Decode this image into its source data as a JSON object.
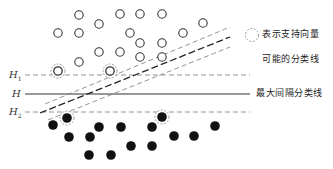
{
  "diagram": {
    "type": "svm-max-margin",
    "colors": {
      "open_stroke": "#333333",
      "filled": "#111111",
      "line": "#333333",
      "dashed": "#777777"
    },
    "labels": {
      "h1": "H",
      "h1_sub": "1",
      "h": "H",
      "h2": "H",
      "h2_sub": "2"
    },
    "legend": {
      "support_vector": "表示支持向量",
      "possible_lines": "可能的分类线",
      "max_margin_line": "最大间隔分类线"
    },
    "open_points": [
      [
        79,
        15
      ],
      [
        120,
        14
      ],
      [
        140,
        14
      ],
      [
        162,
        14
      ],
      [
        99,
        24
      ],
      [
        203,
        23
      ],
      [
        58,
        33
      ],
      [
        79,
        33
      ],
      [
        130,
        33
      ],
      [
        183,
        33
      ],
      [
        140,
        43
      ],
      [
        162,
        43
      ],
      [
        99,
        52
      ],
      [
        120,
        52
      ],
      [
        140,
        57
      ],
      [
        162,
        57
      ],
      [
        79,
        62
      ]
    ],
    "open_support_vectors": [
      [
        58,
        71
      ],
      [
        110,
        71
      ]
    ],
    "filled_points": [
      [
        53,
        125
      ],
      [
        99,
        127
      ],
      [
        121,
        127
      ],
      [
        152,
        127
      ],
      [
        215,
        126
      ],
      [
        69,
        137
      ],
      [
        90,
        137
      ],
      [
        174,
        136
      ],
      [
        194,
        136
      ],
      [
        131,
        146
      ],
      [
        152,
        146
      ],
      [
        89,
        155
      ],
      [
        111,
        155
      ]
    ],
    "filled_support_vectors": [
      [
        67,
        118
      ],
      [
        162,
        117
      ]
    ],
    "hlines": {
      "h1_y": 75,
      "h_y": 94,
      "h2_y": 112,
      "x_start": 25,
      "x_end": 250
    },
    "diagonals": [
      {
        "x1": 45,
        "y1": 104,
        "x2": 230,
        "y2": 27,
        "style": "thin-dash"
      },
      {
        "x1": 40,
        "y1": 113,
        "x2": 230,
        "y2": 37,
        "style": "thick-dash"
      },
      {
        "x1": 48,
        "y1": 120,
        "x2": 230,
        "y2": 47,
        "style": "thin-dash"
      }
    ]
  }
}
